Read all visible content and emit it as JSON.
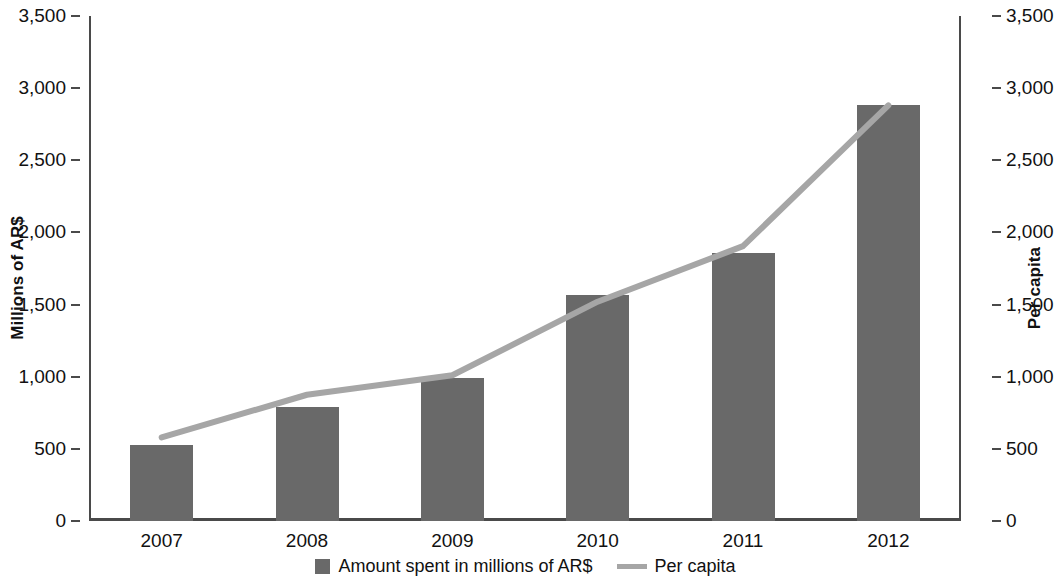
{
  "chart_data": {
    "type": "bar",
    "title": "",
    "subtitle": "",
    "xlabel": "",
    "ylabel": "Millions of AR$",
    "y2label": "Per capita",
    "categories": [
      "2007",
      "2008",
      "2009",
      "2010",
      "2011",
      "2012"
    ],
    "ylim": [
      0,
      3500
    ],
    "y2lim": [
      0,
      3500
    ],
    "ytick_step": 500,
    "yticks": [
      0,
      500,
      1000,
      1500,
      2000,
      2500,
      3000,
      3500
    ],
    "ytick_labels": [
      "0",
      "500",
      "1,000",
      "1,500",
      "2,000",
      "2,500",
      "3,000",
      "3,500"
    ],
    "y2tick_labels": [
      "0",
      "500",
      "1,000",
      "1,500",
      "2,000",
      "2,500",
      "3,000",
      "3,500"
    ],
    "grid": false,
    "legend_position": "bottom-center",
    "series": [
      {
        "name": "Amount spent in millions of AR$",
        "type": "bar",
        "axis": "left",
        "color": "#696969",
        "values": [
          525,
          790,
          990,
          1565,
          1860,
          2880
        ]
      },
      {
        "name": "Per capita",
        "type": "line",
        "axis": "right",
        "color": "#a6a6a6",
        "values": [
          580,
          875,
          1010,
          1520,
          1905,
          2880
        ]
      }
    ]
  },
  "axes": {
    "left_title": "Millions of AR$",
    "right_title": "Per capita",
    "left_tick_labels": [
      "3,500",
      "3,000",
      "2,500",
      "2,000",
      "1,500",
      "1,000",
      "500",
      "0"
    ],
    "right_tick_labels": [
      "3,500",
      "3,000",
      "2,500",
      "2,000",
      "1,500",
      "1,000",
      "500",
      "0"
    ],
    "x_tick_labels": [
      "2007",
      "2008",
      "2009",
      "2010",
      "2011",
      "2012"
    ]
  },
  "legend": {
    "items": [
      {
        "label": "Amount spent in millions of AR$",
        "marker": "square-swatch-icon",
        "color": "#696969"
      },
      {
        "label": "Per capita",
        "marker": "line-swatch-icon",
        "color": "#a6a6a6"
      }
    ]
  }
}
